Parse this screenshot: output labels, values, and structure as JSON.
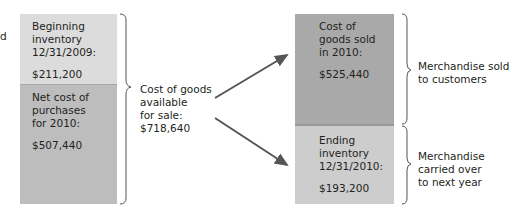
{
  "left_column": {
    "cut_text": "d",
    "beginning_inventory": {
      "label": "Beginning\ninventory\n12/31/2009:",
      "value": "$211,200",
      "color": "#dcdcdc"
    },
    "net_purchases": {
      "label": "Net cost of\npurchases\nfor 2010:",
      "value": "$507,440",
      "color": "#bdbdbd"
    }
  },
  "middle": {
    "label": "Cost of goods\navailable\nfor sale:\n$718,640"
  },
  "right_column": {
    "cogs": {
      "label": "Cost of\ngoods sold\nin 2010:",
      "value": "$525,440",
      "color": "#a9a9a9"
    },
    "ending_inventory": {
      "label": "Ending\ninventory\n12/31/2010:",
      "value": "$193,200",
      "color": "#cdcdcd"
    }
  },
  "annotations": {
    "sold": "Merchandise sold\nto customers",
    "carried": "Merchandise\ncarried over\nto next year"
  }
}
